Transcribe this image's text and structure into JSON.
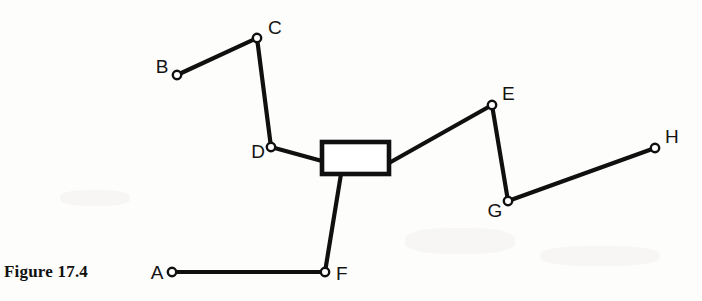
{
  "figure": {
    "caption": "Figure 17.4",
    "caption_x": 4,
    "caption_y": 262
  },
  "diagram": {
    "type": "mechanism-linkage",
    "background_color": "#fdfdfc",
    "stroke_color": "#101010",
    "joint_fill_color": "#ffffff",
    "link_width": 4.2,
    "joint_radius": 4.2,
    "nodes": [
      {
        "id": "A",
        "label": "A",
        "x": 172,
        "y": 272,
        "label_x": 157,
        "label_y": 279,
        "label_anchor": "middle"
      },
      {
        "id": "B",
        "label": "B",
        "x": 177,
        "y": 75,
        "label_x": 162,
        "label_y": 73,
        "label_anchor": "middle"
      },
      {
        "id": "C",
        "label": "C",
        "x": 257,
        "y": 38,
        "label_x": 268,
        "label_y": 34,
        "label_anchor": "start"
      },
      {
        "id": "D",
        "label": "D",
        "x": 271,
        "y": 147,
        "label_x": 258,
        "label_y": 158,
        "label_anchor": "middle"
      },
      {
        "id": "E",
        "label": "E",
        "x": 492,
        "y": 105,
        "label_x": 502,
        "label_y": 100,
        "label_anchor": "start"
      },
      {
        "id": "F",
        "label": "F",
        "x": 325,
        "y": 272,
        "label_x": 336,
        "label_y": 280,
        "label_anchor": "start"
      },
      {
        "id": "G",
        "label": "G",
        "x": 508,
        "y": 201,
        "label_x": 495,
        "label_y": 217,
        "label_anchor": "middle"
      },
      {
        "id": "H",
        "label": "H",
        "x": 655,
        "y": 148,
        "label_x": 665,
        "label_y": 143,
        "label_anchor": "start"
      }
    ],
    "block": {
      "id": "slider-block",
      "x": 322,
      "y": 142,
      "width": 67,
      "height": 32
    },
    "links": [
      {
        "id": "link-B-C",
        "from": "B",
        "to": "C",
        "x1": 177,
        "y1": 75,
        "x2": 257,
        "y2": 38
      },
      {
        "id": "link-C-D",
        "from": "C",
        "to": "D",
        "x1": 257,
        "y1": 38,
        "x2": 271,
        "y2": 147
      },
      {
        "id": "link-D-block",
        "from": "D",
        "to": "block-left",
        "x1": 271,
        "y1": 147,
        "x2": 322,
        "y2": 161
      },
      {
        "id": "link-block-E",
        "from": "block-right",
        "to": "E",
        "x1": 389,
        "y1": 163,
        "x2": 492,
        "y2": 105
      },
      {
        "id": "link-E-G",
        "from": "E",
        "to": "G",
        "x1": 492,
        "y1": 105,
        "x2": 508,
        "y2": 201
      },
      {
        "id": "link-G-H",
        "from": "G",
        "to": "H",
        "x1": 508,
        "y1": 201,
        "x2": 655,
        "y2": 148
      },
      {
        "id": "link-block-F",
        "from": "block-bottom",
        "to": "F",
        "x1": 341,
        "y1": 174,
        "x2": 325,
        "y2": 272
      },
      {
        "id": "link-F-A",
        "from": "F",
        "to": "A",
        "x1": 325,
        "y1": 272,
        "x2": 172,
        "y2": 272
      }
    ]
  }
}
